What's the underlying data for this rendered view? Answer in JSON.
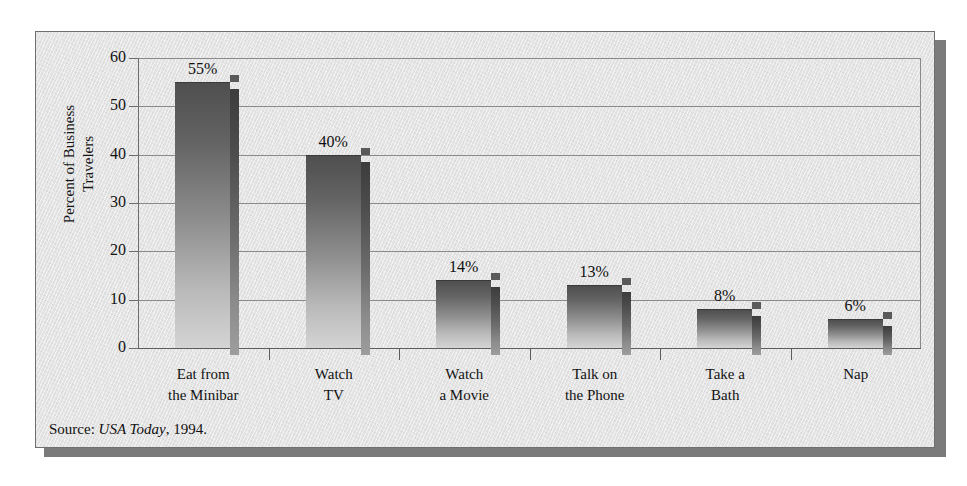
{
  "figure": {
    "source_prefix": "Source: ",
    "source_publication": "USA Today",
    "source_suffix": ", 1994."
  },
  "chart_data": {
    "type": "bar",
    "title": "",
    "subtitle": "",
    "xlabel": "",
    "ylabel": "Percent of Business\nTravelers",
    "categories": [
      "Eat from\nthe Minibar",
      "Watch\nTV",
      "Watch\na Movie",
      "Talk on\nthe Phone",
      "Take a\nBath",
      "Nap"
    ],
    "values": [
      55,
      40,
      14,
      13,
      8,
      6
    ],
    "data_labels": [
      "55%",
      "40%",
      "14%",
      "13%",
      "8%",
      "6%"
    ],
    "ylim": [
      0,
      60
    ],
    "ytick_labels": [
      "0",
      "10",
      "20",
      "30",
      "40",
      "50",
      "60"
    ],
    "ytick_values": [
      0,
      10,
      20,
      30,
      40,
      50,
      60
    ],
    "grid": true,
    "legend": false,
    "legend_position": "none",
    "bar_color": "#8e8e8e",
    "bar_color_top": "#4f4f4f",
    "bar_color_bottom": "#d4d4d4",
    "bar_side_color": "#6b6b6b",
    "background_color": "#e3e3e3",
    "axis_color": "#5d5d5d",
    "grid_color": "#8a8a8a",
    "text_color": "#121212"
  }
}
